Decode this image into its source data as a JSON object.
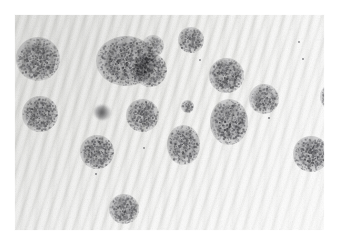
{
  "image": {
    "kind": "photomicrograph",
    "subject": "bacterial colonies on striated membrane filter",
    "alt_text": "Grayscale micrograph showing numerous round speckled colonies scattered across a pale agar membrane with fine diagonal striations",
    "width": 340,
    "height": 244,
    "border": {
      "color": "#ffffff",
      "left": 14,
      "top": 14,
      "right": 15,
      "bottom": 13
    },
    "palette": {
      "background": "#f4f4f2",
      "background_light": "#fbfbfa",
      "background_shadow": "#e9e9e6",
      "colony_dark": "#5c5c60",
      "colony_mid": "#8a8a8e",
      "colony_light": "#b8b8bc",
      "artifact": "#3e3e42",
      "frame": "#ffffff"
    },
    "texture": {
      "pattern": "diagonal wavy striations",
      "angle_deg": 108,
      "period_px": 9,
      "grain": "fine photographic speckle"
    }
  },
  "features": {
    "colony_count": 17,
    "artifact_count": 1,
    "flyspeck_count": 9,
    "colonies": [
      {
        "id": "colony-01",
        "cx": 24,
        "cy": 45,
        "d": 44,
        "shape": "round",
        "tone": 0.95,
        "note": "cut off at left edge"
      },
      {
        "id": "colony-02",
        "cx": 112,
        "cy": 47,
        "d": 52,
        "shape": "lobed",
        "tone": 1.0,
        "note": "large merged cluster"
      },
      {
        "id": "colony-03",
        "cx": 136,
        "cy": 56,
        "d": 34,
        "shape": "round",
        "tone": 0.92,
        "note": "fused lower lobe of cluster"
      },
      {
        "id": "colony-04",
        "cx": 139,
        "cy": 32,
        "d": 22,
        "shape": "round",
        "tone": 0.72,
        "note": "faint upper satellite"
      },
      {
        "id": "colony-05",
        "cx": 177,
        "cy": 26,
        "d": 26,
        "shape": "round",
        "tone": 0.9,
        "note": "clipped at top edge"
      },
      {
        "id": "colony-06",
        "cx": 212,
        "cy": 61,
        "d": 35,
        "shape": "round",
        "tone": 0.98
      },
      {
        "id": "colony-07",
        "cx": 250,
        "cy": 85,
        "d": 30,
        "shape": "round",
        "tone": 0.9
      },
      {
        "id": "colony-08",
        "cx": 320,
        "cy": 83,
        "d": 28,
        "shape": "round",
        "tone": 0.85,
        "note": "cut off at right edge"
      },
      {
        "id": "colony-09",
        "cx": 26,
        "cy": 100,
        "d": 36,
        "shape": "round",
        "tone": 0.95,
        "note": "cut off at left edge"
      },
      {
        "id": "colony-10",
        "cx": 128,
        "cy": 101,
        "d": 33,
        "shape": "round",
        "tone": 0.95
      },
      {
        "id": "colony-11",
        "cx": 173,
        "cy": 92,
        "d": 13,
        "shape": "round",
        "tone": 0.85,
        "note": "small isolated colony"
      },
      {
        "id": "colony-12",
        "cx": 215,
        "cy": 108,
        "d": 38,
        "shape": "oval",
        "tone": 1.0,
        "note": "elongated vertically"
      },
      {
        "id": "colony-13",
        "cx": 169,
        "cy": 131,
        "d": 33,
        "shape": "oval",
        "tone": 0.98
      },
      {
        "id": "colony-14",
        "cx": 83,
        "cy": 138,
        "d": 34,
        "shape": "round",
        "tone": 0.96
      },
      {
        "id": "colony-15",
        "cx": 297,
        "cy": 140,
        "d": 36,
        "shape": "round",
        "tone": 0.98
      },
      {
        "id": "colony-16",
        "cx": 110,
        "cy": 195,
        "d": 30,
        "shape": "round",
        "tone": 0.93
      },
      {
        "id": "colony-17",
        "cx": 325,
        "cy": 48,
        "d": 16,
        "shape": "round",
        "tone": 0.62,
        "note": "faint, clipped at right edge"
      }
    ],
    "artifact": {
      "id": "debris-spot",
      "cx": 88,
      "cy": 98,
      "w": 17,
      "h": 15,
      "note": "dark blurred debris particle"
    },
    "flyspecks": [
      {
        "cx": 168,
        "cy": 34,
        "d": 2.2
      },
      {
        "cx": 186,
        "cy": 46,
        "d": 1.8
      },
      {
        "cx": 285,
        "cy": 28,
        "d": 2.0
      },
      {
        "cx": 289,
        "cy": 45,
        "d": 1.6
      },
      {
        "cx": 132,
        "cy": 88,
        "d": 1.8
      },
      {
        "cx": 130,
        "cy": 134,
        "d": 2.0
      },
      {
        "cx": 82,
        "cy": 160,
        "d": 1.6
      },
      {
        "cx": 107,
        "cy": 218,
        "d": 1.6
      },
      {
        "cx": 255,
        "cy": 104,
        "d": 1.5
      }
    ]
  }
}
